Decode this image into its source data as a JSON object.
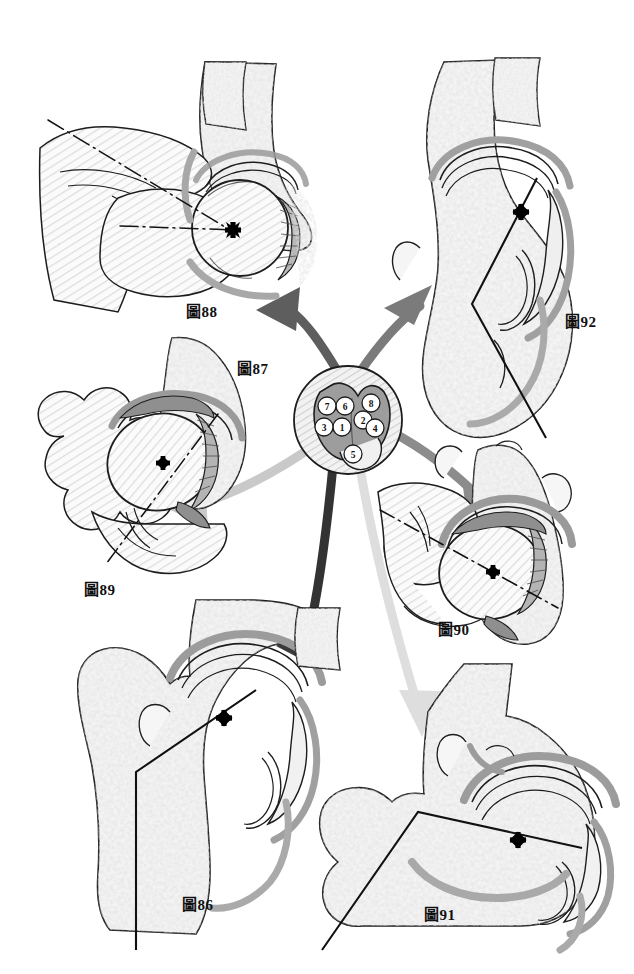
{
  "plate": {
    "title": "Hip joint cross-section orientation plate",
    "background_color": "#ffffff",
    "width": 634,
    "height": 974
  },
  "palette": {
    "outline": "#1a1a1a",
    "bone_fill": "#f4f4f4",
    "trabecular": "#c9c9c9",
    "cartilage_dark": "#9a9a9a",
    "cartilage_mid": "#b5b5b5",
    "hatch": "#d8d8d8",
    "arrow_dark": "#4a4a4a",
    "arrow_mid": "#808080",
    "arrow_light": "#b8b8b8",
    "arrow_pale": "#dcdcdc",
    "marker": "#000000"
  },
  "center": {
    "label": "圖87",
    "label_x": 237,
    "label_y": 357,
    "hub_cx": 348,
    "hub_cy": 420,
    "hub_r": 54,
    "numbered_points": [
      {
        "n": "1",
        "cx": 342,
        "cy": 427,
        "r": 9
      },
      {
        "n": "2",
        "cx": 363,
        "cy": 420,
        "r": 9
      },
      {
        "n": "3",
        "cx": 324,
        "cy": 427,
        "r": 9
      },
      {
        "n": "4",
        "cx": 375,
        "cy": 428,
        "r": 9
      },
      {
        "n": "5",
        "cx": 353,
        "cy": 454,
        "r": 9
      },
      {
        "n": "6",
        "cx": 345,
        "cy": 406,
        "r": 9
      },
      {
        "n": "7",
        "cx": 327,
        "cy": 406,
        "r": 9
      },
      {
        "n": "8",
        "cx": 371,
        "cy": 403,
        "r": 9
      }
    ]
  },
  "panels": [
    {
      "id": "fig88",
      "label": "圖88",
      "label_x": 186,
      "label_y": 300,
      "position": "top-left",
      "axis_style": "dash-dot",
      "marker": "x",
      "marker_x": 233,
      "marker_y": 230
    },
    {
      "id": "fig92",
      "label": "圖92",
      "label_x": 565,
      "label_y": 310,
      "position": "top-right",
      "axis_style": "solid-bent",
      "marker": "x",
      "marker_x": 521,
      "marker_y": 212
    },
    {
      "id": "fig89",
      "label": "圖89",
      "label_x": 84,
      "label_y": 578,
      "position": "middle-left",
      "axis_style": "dash-dot",
      "marker": "x",
      "marker_x": 163,
      "marker_y": 463
    },
    {
      "id": "fig90",
      "label": "圖90",
      "label_x": 438,
      "label_y": 618,
      "position": "middle-right",
      "axis_style": "dash-dot",
      "marker": "x",
      "marker_x": 493,
      "marker_y": 572
    },
    {
      "id": "fig86",
      "label": "圖86",
      "label_x": 182,
      "label_y": 893,
      "position": "bottom-left",
      "axis_style": "solid-bent",
      "marker": "x",
      "marker_x": 224,
      "marker_y": 718
    },
    {
      "id": "fig91",
      "label": "圖91",
      "label_x": 424,
      "label_y": 903,
      "position": "bottom-right",
      "axis_style": "solid-bent",
      "marker": "x",
      "marker_x": 518,
      "marker_y": 840
    }
  ],
  "connectors": [
    {
      "id": "to-fig88",
      "target": "fig88",
      "color": "#5a5a5a",
      "width": 9
    },
    {
      "id": "to-fig92",
      "target": "fig92",
      "color": "#777777",
      "width": 9
    },
    {
      "id": "to-fig89",
      "target": "fig89",
      "color": "#c9c9c9",
      "width": 9
    },
    {
      "id": "to-fig90",
      "target": "fig90",
      "color": "#8c8c8c",
      "width": 9
    },
    {
      "id": "to-fig86",
      "target": "fig86",
      "color": "#3a3a3a",
      "width": 9
    },
    {
      "id": "to-fig91",
      "target": "fig91",
      "color": "#dadada",
      "width": 9
    }
  ]
}
